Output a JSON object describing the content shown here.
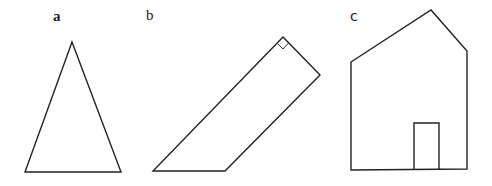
{
  "figure": {
    "panels": [
      {
        "id": "a",
        "label": "a",
        "shape": "isosceles-triangle"
      },
      {
        "id": "b",
        "label": "b",
        "shape": "quadrilateral-with-right-angle"
      },
      {
        "id": "c",
        "label": "c",
        "shape": "house-pentagon-with-door"
      }
    ],
    "colors": {
      "stroke": "#222222",
      "background": "#ffffff"
    }
  }
}
